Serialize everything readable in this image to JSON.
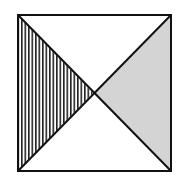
{
  "figure": {
    "square": {
      "x1": 18,
      "y1": 15,
      "x2": 171,
      "y2": 171
    },
    "center": {
      "x": 93,
      "y": 93
    },
    "regions": [
      {
        "name": "left-triangle",
        "fill": "vertical-hatch"
      },
      {
        "name": "right-triangle",
        "fill": "#d4d4d4"
      },
      {
        "name": "top-triangle",
        "fill": "#ffffff"
      },
      {
        "name": "bottom-triangle",
        "fill": "#ffffff"
      }
    ],
    "colors": {
      "stroke": "#111111",
      "shade": "#d4d4d4",
      "hatch": "#222222",
      "background": "#ffffff"
    }
  }
}
